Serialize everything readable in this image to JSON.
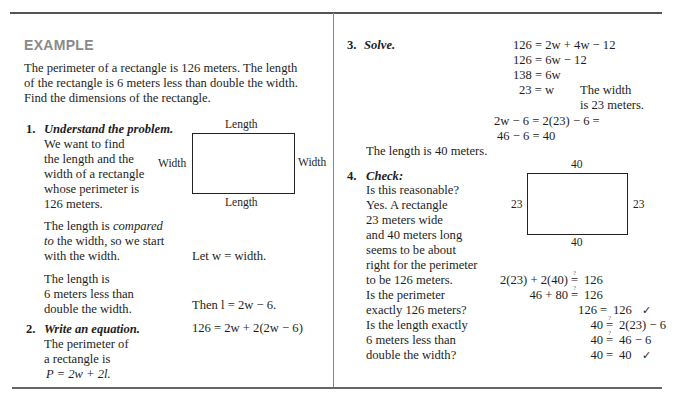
{
  "heading": "EXAMPLE",
  "problem": [
    "The perimeter of a rectangle is 126 meters. The length",
    "of the rectangle is 6 meters less than double the width.",
    "Find the dimensions of the rectangle."
  ],
  "step1": {
    "number": "1.",
    "title": "Understand the problem.",
    "text_a": [
      "We want to find",
      "the length and the",
      "width of a rectangle",
      "whose perimeter is",
      "126 meters."
    ],
    "text_b_1_pre": "The length is ",
    "text_b_1_it": "compared",
    "text_b_2_it": "to",
    "text_b_2_post": " the width, so we start",
    "text_b_3": "with the width.",
    "text_c": [
      "The length is",
      "6 meters less than",
      "double the width."
    ],
    "let_w": "Let w = width.",
    "then_l": "Then l = 2w − 6.",
    "diagram": {
      "top": "Length",
      "bottom": "Length",
      "left": "Width",
      "right": "Width"
    }
  },
  "step2": {
    "number": "2.",
    "title": "Write an equation.",
    "text": [
      "The perimeter of",
      "a rectangle is",
      "P = 2w + 2l."
    ],
    "equation": "126 = 2w + 2(2w − 6)"
  },
  "step3": {
    "number": "3.",
    "title": "Solve.",
    "lines": [
      "126 = 2w + 4w − 12",
      "126 = 6w − 12",
      "138 = 6w",
      "23 = w",
      "2w − 6 = 2(23) − 6 =",
      "46 − 6 = 40"
    ],
    "note": [
      "The width",
      "is 23 meters."
    ],
    "conclusion": "The length is 40 meters."
  },
  "step4": {
    "number": "4.",
    "title": "Check:",
    "text": [
      "Is this reasonable?",
      "Yes. A rectangle",
      "23 meters wide",
      "and 40 meters long",
      "seems to be about",
      "right for the perimeter",
      "to be 126 meters.",
      "Is the perimeter",
      "exactly 126 meters?",
      "Is the length exactly",
      "6 meters less than",
      "double the width?"
    ],
    "diagram": {
      "top": "40",
      "bottom": "40",
      "left": "23",
      "right": "23"
    },
    "checks": [
      {
        "lhs": "2(23) + 2(40)",
        "op": "=",
        "q": "?",
        "rhs": "126",
        "mark": ""
      },
      {
        "lhs": "46 + 80",
        "op": "=",
        "q": "?",
        "rhs": "126",
        "mark": ""
      },
      {
        "lhs": "126",
        "op": "=",
        "q": "",
        "rhs": "126",
        "mark": "✓"
      },
      {
        "lhs": "40",
        "op": "=",
        "q": "?",
        "rhs": "2(23) − 6",
        "mark": ""
      },
      {
        "lhs": "40",
        "op": "=",
        "q": "?",
        "rhs": "46 − 6",
        "mark": ""
      },
      {
        "lhs": "40",
        "op": "=",
        "q": "",
        "rhs": "40",
        "mark": "✓"
      }
    ]
  },
  "colors": {
    "heading": "#8a8a8a",
    "text": "#1e1e1e",
    "rule": "#555555"
  }
}
